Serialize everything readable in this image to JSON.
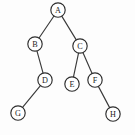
{
  "figure": {
    "kind": "binary-tree-diagram",
    "title": "",
    "width": 135,
    "height": 135,
    "background_color": "#fdfdfd",
    "node_fill_color": "#ffffff",
    "node_stroke_color": "#2e2e2e",
    "edge_stroke_color": "#3a3a3a",
    "label_color": "#1d1d1d",
    "node_radius": 7.2,
    "root": "A"
  },
  "nodes": [
    {
      "id": "A",
      "label": "A",
      "x": 58,
      "y": 10,
      "depth": 0
    },
    {
      "id": "B",
      "label": "B",
      "x": 35,
      "y": 44,
      "depth": 1
    },
    {
      "id": "C",
      "label": "C",
      "x": 80,
      "y": 46,
      "depth": 1
    },
    {
      "id": "D",
      "label": "D",
      "x": 45,
      "y": 80,
      "depth": 2
    },
    {
      "id": "E",
      "label": "E",
      "x": 72,
      "y": 84,
      "depth": 2
    },
    {
      "id": "F",
      "label": "F",
      "x": 95,
      "y": 80,
      "depth": 2
    },
    {
      "id": "G",
      "label": "G",
      "x": 18,
      "y": 113,
      "depth": 3
    },
    {
      "id": "H",
      "label": "H",
      "x": 113,
      "y": 114,
      "depth": 3
    }
  ],
  "edges": [
    {
      "from": "A",
      "to": "B",
      "side": "left"
    },
    {
      "from": "A",
      "to": "C",
      "side": "right"
    },
    {
      "from": "B",
      "to": "D",
      "side": "right"
    },
    {
      "from": "C",
      "to": "E",
      "side": "left"
    },
    {
      "from": "C",
      "to": "F",
      "side": "right"
    },
    {
      "from": "D",
      "to": "G",
      "side": "left"
    },
    {
      "from": "F",
      "to": "H",
      "side": "right"
    }
  ]
}
